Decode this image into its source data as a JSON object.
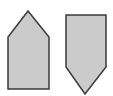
{
  "canvas": {
    "width": 113,
    "height": 96,
    "background": "#ffffff"
  },
  "style": {
    "fill": "#cbcbcb",
    "stroke": "#3a3a3a",
    "stroke_width": 1.5
  },
  "shapes": [
    {
      "name": "pentagon-up",
      "points": "28,11 49,37 49,89 8,89 8,37"
    },
    {
      "name": "pentagon-down",
      "points": "66,15 106,15 106,67 85,94 66,67"
    }
  ]
}
